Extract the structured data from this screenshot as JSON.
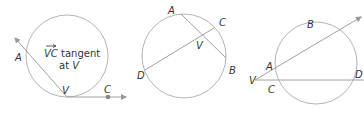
{
  "figures": [
    {
      "id": "tangent-secant",
      "labels": {
        "A": "A",
        "V": "V",
        "C": "C"
      },
      "annotation": {
        "vector": "VC",
        "line1_rest": " tangent",
        "line2_prefix": "at ",
        "line2_var": "V"
      }
    },
    {
      "id": "two-chords",
      "labels": {
        "A": "A",
        "B": "B",
        "C": "C",
        "D": "D",
        "V": "V"
      }
    },
    {
      "id": "two-secants",
      "labels": {
        "A": "A",
        "B": "B",
        "C": "C",
        "D": "D",
        "V": "V"
      }
    }
  ],
  "colors": {
    "line": "#a0a0a0",
    "circle": "#b4b4b4",
    "text": "#333333",
    "point": "#888888"
  }
}
